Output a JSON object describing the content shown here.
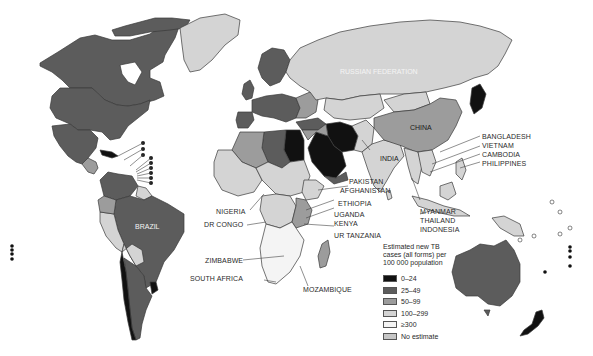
{
  "map": {
    "title": "Estimated TB incidence rates by country",
    "colors": {
      "0-24": "#111111",
      "25-49": "#5c5c5c",
      "50-99": "#9c9c9c",
      "100-299": "#d4d4d4",
      ">300": "#f4f4f4",
      "no_estimate": "#c6c6c6",
      "ocean": "#ffffff",
      "border": "#3a3a3a"
    },
    "inline_labels": {
      "russia": "RUSSIAN FEDERATION",
      "china": "CHINA",
      "india": "INDIA",
      "brazil": "BRAZIL"
    },
    "callout_labels": {
      "bangladesh": "BANGLADESH",
      "vietnam": "VIETNAM",
      "cambodia": "CAMBODIA",
      "philippines": "PHILIPPINES",
      "pakistan": "PAKISTAN",
      "afghanistan": "AFGHANISTAN",
      "ethiopia": "ETHIOPIA",
      "uganda": "UGANDA",
      "kenya": "KENYA",
      "ur_tanzania": "UR TANZANIA",
      "myanmar": "MYANMAR",
      "thailand": "THAILAND",
      "indonesia": "INDONESIA",
      "nigeria": "NIGERIA",
      "dr_congo": "DR CONGO",
      "zimbabwe": "ZIMBABWE",
      "south_africa": "SOUTH AFRICA",
      "mozambique": "MOZAMBIQUE"
    }
  },
  "legend": {
    "title_line1": "Estimated new TB",
    "title_line2": "cases (all forms) per",
    "title_line3": "100 000 population",
    "items": [
      {
        "label": "0–24",
        "color": "#111111"
      },
      {
        "label": "25–49",
        "color": "#5c5c5c"
      },
      {
        "label": "50–99",
        "color": "#9c9c9c"
      },
      {
        "label": "100–299",
        "color": "#d4d4d4"
      },
      {
        "label": "≥300",
        "color": "#f4f4f4"
      },
      {
        "label": "No estimate",
        "color": "#c6c6c6"
      }
    ]
  }
}
